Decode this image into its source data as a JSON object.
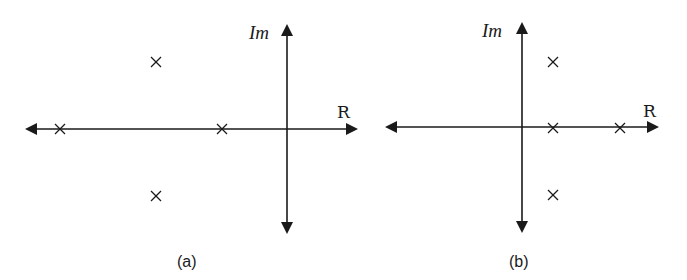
{
  "panels": [
    {
      "id": "a",
      "caption": "(a)",
      "imag_axis_label": "Im",
      "real_axis_label": "R",
      "poles_description": "two poles on negative real axis, complex conjugate pair in left half-plane",
      "poles_px": [
        [
          60,
          129
        ],
        [
          222,
          129
        ],
        [
          156,
          62
        ],
        [
          156,
          196
        ]
      ]
    },
    {
      "id": "b",
      "caption": "(b)",
      "imag_axis_label": "Im",
      "real_axis_label": "R",
      "poles_description": "two poles on positive real axis, complex conjugate pair in right half-plane",
      "poles_px": [
        [
          553,
          128
        ],
        [
          620,
          128
        ],
        [
          553,
          62
        ],
        [
          553,
          195
        ]
      ]
    }
  ]
}
